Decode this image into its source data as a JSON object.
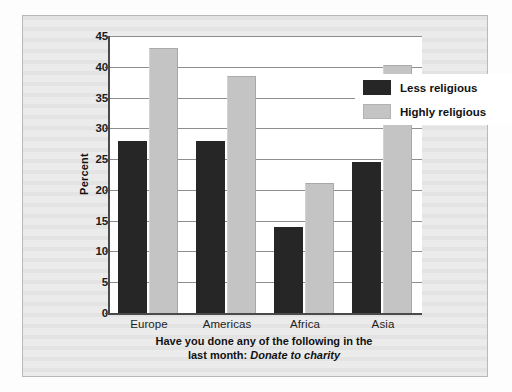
{
  "chart_data": {
    "type": "bar",
    "title": "",
    "xlabel": "Have you done any of the following in the last month: Donate to charity",
    "ylabel": "Percent",
    "ylim": [
      0,
      45
    ],
    "yticks": [
      0,
      5,
      10,
      15,
      20,
      25,
      30,
      35,
      40,
      45
    ],
    "grid": true,
    "legend_position": "top-right",
    "categories": [
      "Europe",
      "Americas",
      "Africa",
      "Asia"
    ],
    "series": [
      {
        "name": "Less religious",
        "color": "#262626",
        "values": [
          28,
          28,
          14,
          24.5
        ]
      },
      {
        "name": "Highly religious",
        "color": "#c4c4c4",
        "values": [
          43,
          38.5,
          21.2,
          40.3
        ]
      }
    ]
  },
  "axis": {
    "y_title": "Percent",
    "tick_labels": [
      "45",
      "40",
      "35",
      "30",
      "25",
      "20",
      "15",
      "10",
      "5",
      "0"
    ],
    "category_labels": [
      "Europe",
      "Americas",
      "Africa",
      "Asia"
    ]
  },
  "legend": {
    "items": [
      {
        "label": "Less religious"
      },
      {
        "label": "Highly religious"
      }
    ]
  },
  "caption": {
    "line1": "Have you done any of the following in the",
    "line2_prefix": "last month: ",
    "line2_emphasis": "Donate to charity"
  },
  "colors": {
    "less_religious": "#262626",
    "highly_religious": "#c4c4c4",
    "axis": "#4a4a4a",
    "gridline": "#8e8e8e",
    "frame_background": "#ebebeb",
    "plot_background": "#ffffff"
  }
}
